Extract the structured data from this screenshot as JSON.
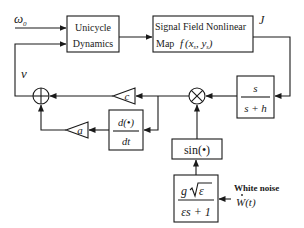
{
  "diagram": {
    "type": "block-diagram",
    "inputs": {
      "omega0": "ω",
      "omega0_sub": "0",
      "white_noise_label": "White noise",
      "white_noise_symbol": "W",
      "white_noise_arg": "(t)"
    },
    "signals": {
      "v": "v",
      "J": "J"
    },
    "blocks": {
      "unicycle": {
        "line1": "Unicycle",
        "line2": "Dynamics"
      },
      "signal_field": {
        "line1": "Signal Field Nonlinear",
        "line2_prefix": "Map",
        "func": "f",
        "args": "(x",
        "sub1": "s",
        "comma": ", y",
        "sub2": "s",
        "close": ")"
      },
      "highpass": {
        "num": "s",
        "den": "s + h"
      },
      "gain_c": "c",
      "gain_a": "a",
      "derivative": {
        "num": "d(•)",
        "den": "dt"
      },
      "sine": "sin(•)",
      "noise_filter": {
        "num_g": "g",
        "num_eps": "ε",
        "den": "εs + 1"
      }
    },
    "junctions": {
      "sum": "summing-junction",
      "multiply": "multiplier-junction"
    },
    "connections": [
      [
        "omega0",
        "unicycle"
      ],
      [
        "v",
        "unicycle"
      ],
      [
        "unicycle",
        "signal_field"
      ],
      [
        "signal_field",
        "highpass"
      ],
      [
        "highpass",
        "multiply"
      ],
      [
        "sine",
        "multiply"
      ],
      [
        "multiply",
        "gain_c"
      ],
      [
        "multiply",
        "derivative"
      ],
      [
        "gain_c",
        "sum"
      ],
      [
        "derivative",
        "gain_a"
      ],
      [
        "gain_a",
        "sum"
      ],
      [
        "sum",
        "v"
      ],
      [
        "noise_filter",
        "sine"
      ],
      [
        "white_noise",
        "noise_filter"
      ]
    ]
  }
}
